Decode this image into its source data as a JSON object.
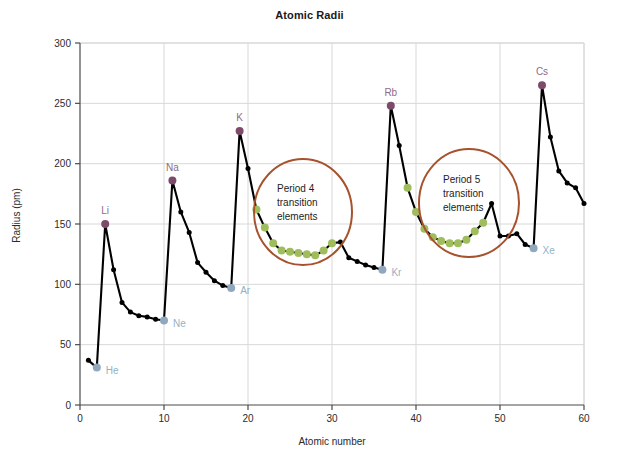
{
  "chart_data": {
    "type": "line",
    "title": "Atomic Radii",
    "xlabel": "Atomic number",
    "ylabel": "Radius (pm)",
    "xlim": [
      0,
      60
    ],
    "ylim": [
      0,
      300
    ],
    "xticks": [
      0,
      10,
      20,
      30,
      40,
      50,
      60
    ],
    "yticks": [
      0,
      50,
      100,
      150,
      200,
      250,
      300
    ],
    "grid": true,
    "legend": "none",
    "series": [
      {
        "name": "Atomic radius",
        "x": [
          1,
          2,
          3,
          4,
          5,
          6,
          7,
          8,
          9,
          10,
          11,
          12,
          13,
          14,
          15,
          16,
          17,
          18,
          19,
          20,
          21,
          22,
          23,
          24,
          25,
          26,
          27,
          28,
          29,
          30,
          31,
          32,
          33,
          34,
          35,
          36,
          37,
          38,
          39,
          40,
          41,
          42,
          43,
          44,
          45,
          46,
          47,
          48,
          49,
          50,
          51,
          52,
          53,
          54,
          55,
          56,
          57,
          58,
          59,
          60
        ],
        "values": [
          37,
          31,
          150,
          112,
          85,
          77,
          74,
          73,
          71,
          70,
          186,
          160,
          143,
          118,
          110,
          103,
          99,
          97,
          227,
          196,
          162,
          147,
          134,
          128,
          127,
          126,
          125,
          124,
          128,
          134,
          135,
          122,
          119,
          116,
          114,
          112,
          248,
          215,
          180,
          160,
          146,
          139,
          136,
          134,
          134,
          137,
          144,
          151,
          167,
          140,
          140,
          142,
          133,
          130,
          265,
          222,
          194,
          184,
          180,
          167
        ]
      }
    ],
    "highlighted_points": [
      {
        "label": "He",
        "x": 2,
        "y": 31,
        "group": "noble-gas"
      },
      {
        "label": "Li",
        "x": 3,
        "y": 150,
        "group": "alkali-metal"
      },
      {
        "label": "Ne",
        "x": 10,
        "y": 70,
        "group": "noble-gas"
      },
      {
        "label": "Na",
        "x": 11,
        "y": 186,
        "group": "alkali-metal"
      },
      {
        "label": "Ar",
        "x": 18,
        "y": 97,
        "group": "noble-gas"
      },
      {
        "label": "K",
        "x": 19,
        "y": 227,
        "group": "alkali-metal"
      },
      {
        "label": "Kr",
        "x": 36,
        "y": 112,
        "group": "noble-gas"
      },
      {
        "label": "Rb",
        "x": 37,
        "y": 248,
        "group": "alkali-metal"
      },
      {
        "label": "Xe",
        "x": 54,
        "y": 130,
        "group": "noble-gas"
      },
      {
        "label": "Cs",
        "x": 55,
        "y": 265,
        "group": "alkali-metal"
      }
    ],
    "transition_ranges": [
      {
        "name": "period-4",
        "x_start": 21,
        "x_end": 30
      },
      {
        "name": "period-5",
        "x_start": 39,
        "x_end": 48
      }
    ],
    "annotations": [
      {
        "name": "period-4-annotation",
        "lines": [
          "Period 4",
          "transition",
          "elements"
        ],
        "circle": {
          "cx": 303,
          "cy": 212,
          "rx": 49,
          "ry": 53
        }
      },
      {
        "name": "period-5-annotation",
        "lines": [
          "Period 5",
          "transition",
          "elements"
        ],
        "circle": {
          "cx": 469,
          "cy": 203,
          "rx": 50,
          "ry": 54
        }
      }
    ],
    "colors": {
      "line": "#000000",
      "marker": "#000000",
      "alkali_marker": "#7d4a69",
      "alkali_label": "#8f6b83",
      "noble_marker": "#8fa8bd",
      "noble_label": "#93b2c6",
      "transition_marker": "#9fbd5c",
      "annotation_circle": "#a6522d",
      "grid": "#d8d8d8",
      "axis": "#4a4a4a",
      "background": "#ffffff",
      "title": "#1a1a1a"
    }
  }
}
